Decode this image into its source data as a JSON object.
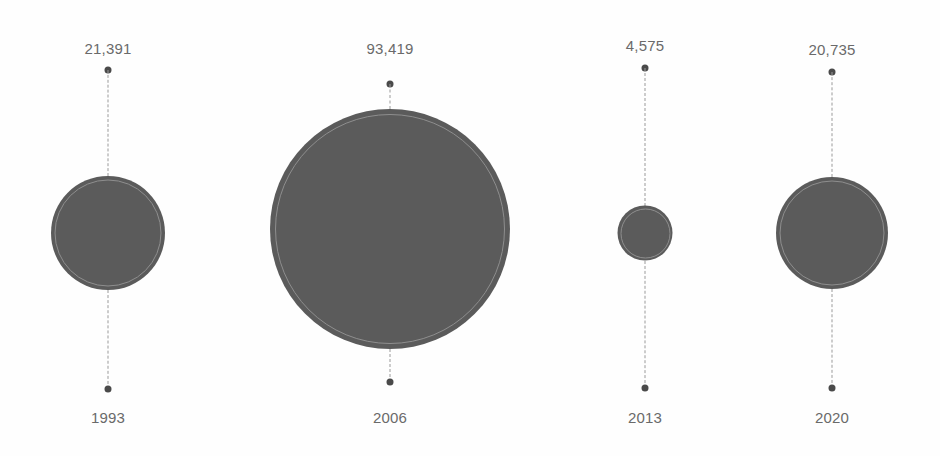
{
  "chart_data": {
    "type": "scatter",
    "title": "",
    "subtitle": "",
    "xlabel": "",
    "ylabel": "",
    "legend": [],
    "grid": false,
    "orientation": "horizontal-timeline",
    "size_encoding": "area-proportional-to-value",
    "categories": [
      "1993",
      "2006",
      "2013",
      "2020"
    ],
    "values": [
      21391,
      93419,
      4575,
      20735
    ],
    "value_labels": [
      "21,391",
      "93,419",
      "4,575",
      "20,735"
    ],
    "points": [
      {
        "year": "1993",
        "value": 21391,
        "value_label": "21,391",
        "center_x": 108,
        "center_y": 233,
        "diameter": 114,
        "label_y": 40,
        "top_dot_y": 70,
        "bottom_dot_y": 389,
        "year_label_y": 409
      },
      {
        "year": "2006",
        "value": 93419,
        "value_label": "93,419",
        "center_x": 390,
        "center_y": 229,
        "diameter": 240,
        "label_y": 40,
        "top_dot_y": 84,
        "bottom_dot_y": 382,
        "year_label_y": 409
      },
      {
        "year": "2013",
        "value": 4575,
        "value_label": "4,575",
        "center_x": 645,
        "center_y": 233,
        "diameter": 55,
        "label_y": 37,
        "top_dot_y": 68,
        "bottom_dot_y": 388,
        "year_label_y": 409
      },
      {
        "year": "2020",
        "value": 20735,
        "value_label": "20,735",
        "center_x": 832,
        "center_y": 233,
        "diameter": 112,
        "label_y": 41,
        "top_dot_y": 72,
        "bottom_dot_y": 388,
        "year_label_y": 409
      }
    ]
  },
  "colors": {
    "background": "#fefefe",
    "bubble_fill": "#5b5b5b",
    "bubble_ring": "#8e8e8e",
    "connector": "#9a9a9a",
    "dot": "#4a4a4a",
    "text": "#6a6a6a"
  }
}
